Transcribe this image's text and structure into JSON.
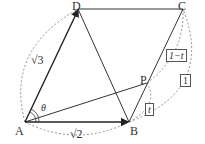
{
  "diagram": {
    "type": "geometry",
    "points": {
      "A": {
        "label": "A",
        "x": 25,
        "y": 122
      },
      "B": {
        "label": "B",
        "x": 129,
        "y": 122
      },
      "C": {
        "label": "C",
        "x": 183,
        "y": 9
      },
      "D": {
        "label": "D",
        "x": 78,
        "y": 9
      },
      "P": {
        "label": "P",
        "x": 147,
        "y": 83
      }
    },
    "labels": {
      "sqrt3": "√3",
      "sqrt2": "√2",
      "theta": "θ",
      "one_minus_t": "1−t",
      "t": "t",
      "one": "1"
    },
    "colors": {
      "line": "#333333",
      "dashed": "#777777"
    }
  }
}
